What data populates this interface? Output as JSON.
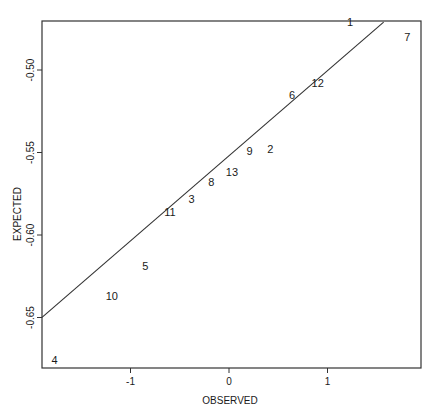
{
  "chart_data": {
    "type": "scatter",
    "title": "",
    "xlabel": "OBSERVED",
    "ylabel": "EXPECTED",
    "xlim": [
      -1.9,
      1.95
    ],
    "ylim": [
      -0.682,
      -0.471
    ],
    "x_ticks": [
      -1,
      0,
      1
    ],
    "x_tick_labels": [
      "-1",
      "0",
      "1"
    ],
    "y_ticks": [
      -0.65,
      -0.6,
      -0.55,
      -0.5
    ],
    "y_tick_labels": [
      "-0.65",
      "-0.60",
      "-0.55",
      "-0.50"
    ],
    "grid": false,
    "legend": null,
    "marker": "text-labels",
    "points": [
      {
        "label": "1",
        "x": 1.23,
        "y": -0.471
      },
      {
        "label": "2",
        "x": 0.42,
        "y": -0.548
      },
      {
        "label": "3",
        "x": -0.38,
        "y": -0.578
      },
      {
        "label": "4",
        "x": -1.77,
        "y": -0.676
      },
      {
        "label": "5",
        "x": -0.85,
        "y": -0.619
      },
      {
        "label": "6",
        "x": 0.64,
        "y": -0.515
      },
      {
        "label": "7",
        "x": 1.81,
        "y": -0.48
      },
      {
        "label": "8",
        "x": -0.18,
        "y": -0.568
      },
      {
        "label": "9",
        "x": 0.21,
        "y": -0.549
      },
      {
        "label": "10",
        "x": -1.19,
        "y": -0.637
      },
      {
        "label": "11",
        "x": -0.6,
        "y": -0.586
      },
      {
        "label": "12",
        "x": 0.9,
        "y": -0.508
      },
      {
        "label": "13",
        "x": 0.03,
        "y": -0.562
      }
    ],
    "reference_line": {
      "description": "fitted line",
      "x": [
        -1.9,
        1.57
      ],
      "y": [
        -0.65,
        -0.471
      ]
    }
  }
}
